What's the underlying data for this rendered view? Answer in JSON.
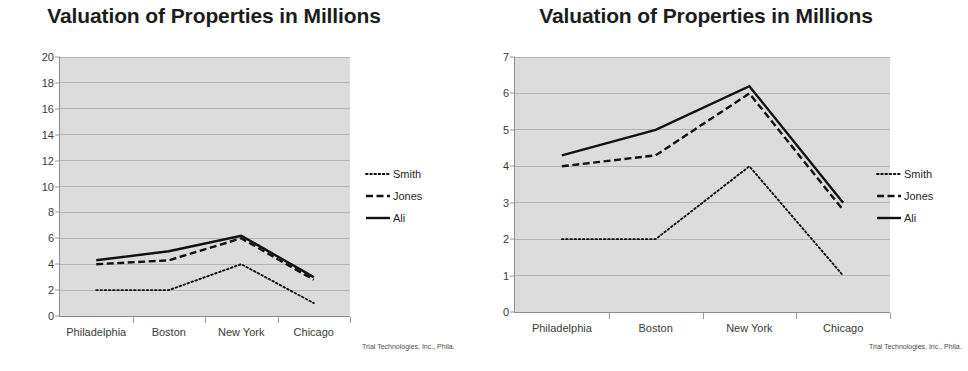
{
  "footer_note": "Trial Technologies, Inc., Phila.",
  "legend": {
    "entries": [
      {
        "label": "Smith",
        "style": "dotted"
      },
      {
        "label": "Jones",
        "style": "dash-dot"
      },
      {
        "label": "Ali",
        "style": "solid"
      }
    ]
  },
  "chart_data": [
    {
      "type": "line",
      "title": "Valuation of Properties in Millions",
      "xlabel": "",
      "ylabel": "",
      "categories": [
        "Philadelphia",
        "Boston",
        "New York",
        "Chicago"
      ],
      "ylim": [
        0,
        20
      ],
      "yticks": [
        0,
        2,
        4,
        6,
        8,
        10,
        12,
        14,
        16,
        18,
        20
      ],
      "ytick_labels": [
        "0",
        "2",
        "4",
        "6",
        "8",
        "10",
        "12",
        "14",
        "16",
        "18",
        "20"
      ],
      "grid": true,
      "legend_position": "right",
      "series": [
        {
          "name": "Smith",
          "style": "dotted",
          "values": [
            2.0,
            2.0,
            4.0,
            1.0
          ]
        },
        {
          "name": "Jones",
          "style": "dash-dot",
          "values": [
            4.0,
            4.3,
            6.0,
            2.8
          ]
        },
        {
          "name": "Ali",
          "style": "solid",
          "values": [
            4.3,
            5.0,
            6.2,
            3.0
          ]
        }
      ]
    },
    {
      "type": "line",
      "title": "Valuation of Properties in Millions",
      "xlabel": "",
      "ylabel": "",
      "categories": [
        "Philadelphia",
        "Boston",
        "New York",
        "Chicago"
      ],
      "ylim": [
        0,
        7
      ],
      "yticks": [
        0,
        1,
        2,
        3,
        4,
        5,
        6,
        7
      ],
      "ytick_labels": [
        "0",
        "1",
        "2",
        "3",
        "4",
        "5",
        "6",
        "7"
      ],
      "grid": true,
      "legend_position": "right",
      "series": [
        {
          "name": "Smith",
          "style": "dotted",
          "values": [
            2.0,
            2.0,
            4.0,
            1.0
          ]
        },
        {
          "name": "Jones",
          "style": "dash-dot",
          "values": [
            4.0,
            4.3,
            6.0,
            2.8
          ]
        },
        {
          "name": "Ali",
          "style": "solid",
          "values": [
            4.3,
            5.0,
            6.2,
            3.0
          ]
        }
      ]
    }
  ],
  "colors": {
    "plot_background": "#dcdcdc",
    "gridline": "#b4b4b4",
    "axis": "#8c8c8c",
    "series_line": "#111111",
    "title_text": "#1c1c1c",
    "tick_text": "#3a3a3a"
  }
}
